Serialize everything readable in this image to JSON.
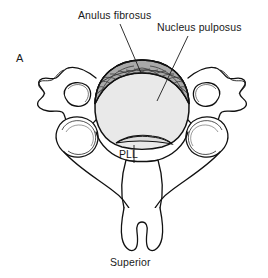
{
  "figure": {
    "panel_label": "A",
    "orientation_label": "Superior",
    "view": "superior-view-cervical-vertebra"
  },
  "labels": {
    "anulus": "Anulus fibrosus",
    "nucleus": "Nucleus pulposus",
    "pll": "PLL"
  },
  "colors": {
    "ink": "#1a1a1a",
    "outline": "#111111",
    "nucleus_fill": "#e9e9e9",
    "anulus_fill": "#a9a9a9",
    "anulus_hatch": "#5a5a5a",
    "pll_fill": "#dcdcdc",
    "background": "#ffffff"
  },
  "structures": [
    {
      "name": "intervertebral-disc-body",
      "fill": "#e9e9e9"
    },
    {
      "name": "anulus-fibrosus-band",
      "fill": "#a9a9a9"
    },
    {
      "name": "posterior-longitudinal-ligament",
      "fill": "#dcdcdc"
    },
    {
      "name": "left-transverse-process",
      "fill": "none"
    },
    {
      "name": "right-transverse-process",
      "fill": "none"
    },
    {
      "name": "left-transverse-foramen",
      "fill": "none"
    },
    {
      "name": "right-transverse-foramen",
      "fill": "none"
    },
    {
      "name": "left-superior-articular-facet",
      "fill": "none"
    },
    {
      "name": "right-superior-articular-facet",
      "fill": "none"
    },
    {
      "name": "vertebral-arch",
      "fill": "none"
    },
    {
      "name": "bifid-spinous-process",
      "fill": "none"
    }
  ]
}
